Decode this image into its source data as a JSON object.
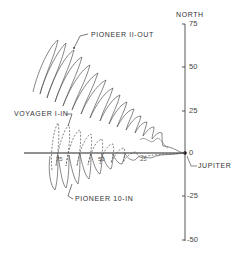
{
  "figure": {
    "type": "trajectory-diagram",
    "vertical_axis": {
      "title": "NORTH",
      "ticks": [
        "75",
        "50",
        "25",
        "0",
        "-25",
        "-50"
      ]
    },
    "horizontal_axis": {
      "ticks": [
        "75",
        "50",
        "25"
      ]
    },
    "origin_label": "JUPITER",
    "trajectories": [
      {
        "name": "PIONEER II-OUT",
        "style": "solid"
      },
      {
        "name": "VOYAGER I-IN",
        "style": "dashed"
      },
      {
        "name": "PIONEER 10-IN",
        "style": "solid"
      }
    ],
    "colors": {
      "ink": "#333333",
      "background": "#ffffff"
    }
  }
}
